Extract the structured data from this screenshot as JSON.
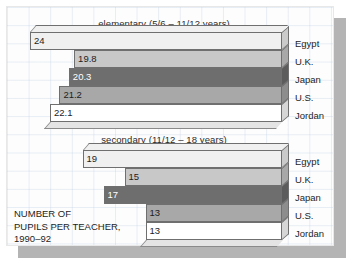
{
  "caption": {
    "line1": "NUMBER OF",
    "line2": "PUPILS PER TEACHER,",
    "line3": "1990–92"
  },
  "colors": {
    "egypt": "#f0f0f0",
    "uk": "#c8c8c8",
    "japan": "#6e6e6e",
    "us": "#a8a8a8",
    "jordan": "#ffffff",
    "outline": "#6f6f6f",
    "frame": "#b4b4b4",
    "grid": "#b4c8e1",
    "text": "#1d1d1d"
  },
  "chart_data": [
    {
      "type": "bar",
      "orientation": "horizontal-right-anchored",
      "title": "elementary (5/6 – 11/12 years)",
      "xlabel": "",
      "ylabel": "",
      "categories": [
        "Egypt",
        "U.K.",
        "Japan",
        "U.S.",
        "Jordan"
      ],
      "values": [
        24,
        19.8,
        20.3,
        21.2,
        22.1
      ],
      "value_labels": [
        "24",
        "19.8",
        "20.3",
        "21.2",
        "22.1"
      ],
      "colors": [
        "#f0f0f0",
        "#c8c8c8",
        "#6e6e6e",
        "#a8a8a8",
        "#ffffff"
      ],
      "xlim": [
        0,
        24
      ],
      "grid": true,
      "legend": "right-side category labels"
    },
    {
      "type": "bar",
      "orientation": "horizontal-right-anchored",
      "title": "secondary (11/12 – 18 years)",
      "xlabel": "",
      "ylabel": "",
      "categories": [
        "Egypt",
        "U.K.",
        "Japan",
        "U.S.",
        "Jordan"
      ],
      "values": [
        19,
        15,
        17,
        13,
        13
      ],
      "value_labels": [
        "19",
        "15",
        "17",
        "13",
        "13"
      ],
      "colors": [
        "#f0f0f0",
        "#c8c8c8",
        "#6e6e6e",
        "#a8a8a8",
        "#ffffff"
      ],
      "xlim": [
        0,
        24
      ],
      "grid": true,
      "legend": "right-side category labels"
    }
  ]
}
